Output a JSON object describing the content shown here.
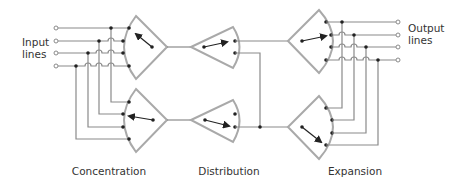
{
  "diagram": {
    "labels": {
      "input": [
        "Input",
        "lines"
      ],
      "output": [
        "Output",
        "lines"
      ],
      "stages": [
        "Concentration",
        "Distribution",
        "Expansion"
      ]
    },
    "colors": {
      "line": "#8a8a8a",
      "stage_outline": "#a9a9a9",
      "dot": "#222222",
      "text": "#333333"
    },
    "stages": [
      {
        "name": "Concentration",
        "units": 2,
        "inputs_per_unit": 4,
        "outputs_per_unit": 1
      },
      {
        "name": "Distribution",
        "units": 2,
        "inputs_per_unit": 1,
        "outputs_per_unit": 2
      },
      {
        "name": "Expansion",
        "units": 2,
        "inputs_per_unit": 1,
        "outputs_per_unit": 4
      }
    ],
    "input_line_count": 4,
    "output_line_count": 4
  }
}
